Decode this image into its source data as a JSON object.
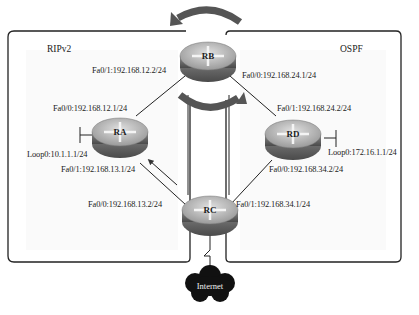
{
  "areas": {
    "left": {
      "label": "RIPv2"
    },
    "right": {
      "label": "OSPF"
    }
  },
  "routers": {
    "RA": {
      "name": "RA"
    },
    "RB": {
      "name": "RB"
    },
    "RC": {
      "name": "RC"
    },
    "RD": {
      "name": "RD"
    }
  },
  "interfaces": {
    "rb_fa01": "Fa0/1:192.168.12.2/24",
    "rb_fa00": "Fa0/0:192.168.24.1/24",
    "ra_fa00": "Fa0/0:192.168.12.1/24",
    "ra_loop0": "Loop0:10.1.1.1/24",
    "ra_fa01": "Fa0/1:192.168.13.1/24",
    "rd_fa01": "Fa0/1:192.168.24.2/24",
    "rd_loop0": "Loop0:172.16.1.1/24",
    "rd_fa00": "Fa0/0:192.168.34.2/24",
    "rc_fa00": "Fa0/0:192.168.13.2/24",
    "rc_fa01": "Fa0/1:192.168.34.1/24"
  },
  "cloud": {
    "label": "Internet"
  },
  "colors": {
    "router_top": "#b8b8b8",
    "router_side": "#6e6e6e",
    "arrow": "#555555",
    "cloud": "#111111",
    "border": "#222222"
  }
}
